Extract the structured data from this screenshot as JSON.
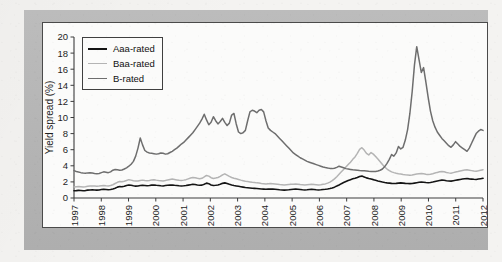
{
  "chart_data": {
    "type": "line",
    "title": "",
    "xlabel": "",
    "ylabel": "Yield spread (%)",
    "ylim": [
      0,
      20
    ],
    "xlim": [
      1997,
      2012
    ],
    "grid": false,
    "legend_position": "top-left",
    "y_ticks": [
      0,
      2,
      4,
      6,
      8,
      10,
      12,
      14,
      16,
      18,
      20
    ],
    "x_ticks": [
      "1997",
      "1998",
      "1999",
      "2000",
      "2001",
      "2002",
      "2003",
      "2004",
      "2005",
      "2006",
      "2007",
      "2008",
      "2009",
      "2010",
      "2011",
      "2012"
    ],
    "series": [
      {
        "name": "Aaa-rated",
        "color": "#141414",
        "width": 1.6,
        "values": [
          0.9,
          0.92,
          0.95,
          0.93,
          0.9,
          0.92,
          0.98,
          1.0,
          1.02,
          1.0,
          0.98,
          1.0,
          1.05,
          1.08,
          1.05,
          1.02,
          1.05,
          1.12,
          1.22,
          1.35,
          1.42,
          1.4,
          1.45,
          1.55,
          1.62,
          1.58,
          1.52,
          1.48,
          1.5,
          1.55,
          1.58,
          1.55,
          1.52,
          1.55,
          1.6,
          1.62,
          1.58,
          1.55,
          1.52,
          1.5,
          1.55,
          1.58,
          1.6,
          1.62,
          1.58,
          1.55,
          1.52,
          1.5,
          1.52,
          1.55,
          1.6,
          1.65,
          1.7,
          1.68,
          1.62,
          1.58,
          1.6,
          1.72,
          1.85,
          1.78,
          1.62,
          1.55,
          1.58,
          1.62,
          1.7,
          1.82,
          1.88,
          1.8,
          1.7,
          1.62,
          1.55,
          1.5,
          1.45,
          1.4,
          1.35,
          1.3,
          1.28,
          1.25,
          1.22,
          1.2,
          1.18,
          1.15,
          1.12,
          1.1,
          1.08,
          1.1,
          1.12,
          1.1,
          1.08,
          1.05,
          1.02,
          1.0,
          0.98,
          1.0,
          1.02,
          1.05,
          1.08,
          1.1,
          1.08,
          1.05,
          1.02,
          1.0,
          1.02,
          1.05,
          1.08,
          1.05,
          1.02,
          1.0,
          1.02,
          1.05,
          1.08,
          1.12,
          1.18,
          1.25,
          1.35,
          1.48,
          1.62,
          1.78,
          1.92,
          2.05,
          2.18,
          2.28,
          2.38,
          2.45,
          2.55,
          2.68,
          2.72,
          2.62,
          2.5,
          2.42,
          2.35,
          2.28,
          2.2,
          2.12,
          2.05,
          1.98,
          1.92,
          1.88,
          1.85,
          1.82,
          1.8,
          1.82,
          1.85,
          1.88,
          1.85,
          1.82,
          1.8,
          1.78,
          1.8,
          1.85,
          1.9,
          1.95,
          1.98,
          1.95,
          1.92,
          1.9,
          1.92,
          1.98,
          2.05,
          2.12,
          2.18,
          2.22,
          2.2,
          2.15,
          2.12,
          2.1,
          2.15,
          2.2,
          2.25,
          2.3,
          2.35,
          2.4,
          2.42,
          2.38,
          2.35,
          2.32,
          2.3,
          2.35,
          2.4,
          2.45
        ]
      },
      {
        "name": "Baa-rated",
        "color": "#b4b4b4",
        "width": 1.5,
        "values": [
          1.38,
          1.4,
          1.42,
          1.4,
          1.38,
          1.4,
          1.45,
          1.48,
          1.5,
          1.48,
          1.45,
          1.48,
          1.52,
          1.55,
          1.52,
          1.5,
          1.55,
          1.65,
          1.8,
          1.95,
          2.05,
          2.02,
          2.08,
          2.18,
          2.28,
          2.22,
          2.15,
          2.1,
          2.12,
          2.18,
          2.22,
          2.18,
          2.15,
          2.18,
          2.25,
          2.28,
          2.22,
          2.18,
          2.15,
          2.12,
          2.18,
          2.25,
          2.3,
          2.35,
          2.3,
          2.25,
          2.2,
          2.18,
          2.22,
          2.28,
          2.38,
          2.48,
          2.55,
          2.52,
          2.45,
          2.4,
          2.45,
          2.62,
          2.8,
          2.72,
          2.52,
          2.42,
          2.48,
          2.55,
          2.68,
          2.88,
          3.0,
          2.85,
          2.68,
          2.55,
          2.45,
          2.38,
          2.3,
          2.22,
          2.15,
          2.08,
          2.05,
          2.0,
          1.95,
          1.92,
          1.88,
          1.85,
          1.8,
          1.78,
          1.75,
          1.78,
          1.8,
          1.78,
          1.75,
          1.72,
          1.68,
          1.65,
          1.62,
          1.65,
          1.68,
          1.7,
          1.72,
          1.75,
          1.72,
          1.68,
          1.65,
          1.62,
          1.65,
          1.68,
          1.7,
          1.68,
          1.65,
          1.62,
          1.65,
          1.7,
          1.75,
          1.85,
          1.98,
          2.15,
          2.38,
          2.65,
          2.95,
          3.25,
          3.55,
          3.85,
          4.15,
          4.45,
          4.8,
          5.1,
          5.55,
          6.05,
          6.25,
          5.95,
          5.55,
          5.35,
          5.65,
          5.45,
          5.15,
          4.85,
          4.5,
          4.15,
          3.85,
          3.6,
          3.4,
          3.25,
          3.15,
          3.08,
          3.02,
          2.98,
          2.92,
          2.88,
          2.85,
          2.82,
          2.85,
          2.92,
          2.98,
          3.02,
          3.05,
          3.0,
          2.95,
          2.92,
          2.95,
          3.02,
          3.1,
          3.18,
          3.25,
          3.28,
          3.25,
          3.18,
          3.12,
          3.08,
          3.15,
          3.22,
          3.28,
          3.35,
          3.42,
          3.48,
          3.5,
          3.45,
          3.4,
          3.35,
          3.32,
          3.38,
          3.45,
          3.52
        ]
      },
      {
        "name": "B-rated",
        "color": "#6e6e6e",
        "width": 1.5,
        "values": [
          3.4,
          3.3,
          3.22,
          3.15,
          3.1,
          3.08,
          3.12,
          3.15,
          3.1,
          3.05,
          3.02,
          3.05,
          3.15,
          3.25,
          3.2,
          3.15,
          3.25,
          3.45,
          3.55,
          3.5,
          3.45,
          3.48,
          3.6,
          3.75,
          3.95,
          4.2,
          4.55,
          5.2,
          6.2,
          7.45,
          6.6,
          5.9,
          5.7,
          5.6,
          5.55,
          5.5,
          5.45,
          5.5,
          5.6,
          5.55,
          5.45,
          5.5,
          5.65,
          5.8,
          6.0,
          6.2,
          6.45,
          6.7,
          6.9,
          7.2,
          7.5,
          7.8,
          8.1,
          8.5,
          8.9,
          9.3,
          9.8,
          10.4,
          9.7,
          9.1,
          9.4,
          10.1,
          9.6,
          9.2,
          9.5,
          9.9,
          9.4,
          9.0,
          9.3,
          10.3,
          10.5,
          9.2,
          8.2,
          8.0,
          8.1,
          8.4,
          9.6,
          10.7,
          10.9,
          10.8,
          10.6,
          10.9,
          11.0,
          10.7,
          9.6,
          8.7,
          8.4,
          8.2,
          8.0,
          7.7,
          7.4,
          7.1,
          6.8,
          6.5,
          6.2,
          5.9,
          5.6,
          5.4,
          5.2,
          5.0,
          4.85,
          4.7,
          4.55,
          4.45,
          4.35,
          4.25,
          4.15,
          4.05,
          3.95,
          3.85,
          3.78,
          3.72,
          3.68,
          3.65,
          3.7,
          3.8,
          3.95,
          3.85,
          3.75,
          3.65,
          3.6,
          3.55,
          3.5,
          3.48,
          3.45,
          3.42,
          3.4,
          3.38,
          3.35,
          3.32,
          3.3,
          3.28,
          3.3,
          3.35,
          3.45,
          3.6,
          3.9,
          4.3,
          4.8,
          5.4,
          5.2,
          5.6,
          6.4,
          6.1,
          6.3,
          7.2,
          8.5,
          10.5,
          13.2,
          16.5,
          18.8,
          17.2,
          15.6,
          16.2,
          14.4,
          12.5,
          10.8,
          9.6,
          8.8,
          8.2,
          7.8,
          7.4,
          7.1,
          6.8,
          6.5,
          6.3,
          6.6,
          7.0,
          6.7,
          6.4,
          6.2,
          6.0,
          5.8,
          6.2,
          6.8,
          7.4,
          8.0,
          8.3,
          8.5,
          8.4
        ]
      }
    ]
  },
  "legend": {
    "items": [
      {
        "label": "Aaa-rated",
        "color": "#141414",
        "thickness": 2.2
      },
      {
        "label": "Baa-rated",
        "color": "#b4b4b4",
        "thickness": 1.6
      },
      {
        "label": "B-rated",
        "color": "#6e6e6e",
        "thickness": 1.6
      }
    ]
  },
  "colors": {
    "mat": "#b9b9b9",
    "panel": "#fbfbfa",
    "axis": "#3c3c3c",
    "page": "#f4f3f1"
  }
}
